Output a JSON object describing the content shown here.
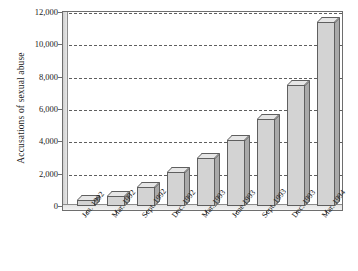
{
  "chart_data": {
    "type": "bar",
    "title": "",
    "xlabel": "",
    "ylabel": "Accusations of sexual abuse",
    "categories": [
      "Jan. 1992",
      "Mar. 1992",
      "Sept. 1992",
      "Dec. 1992",
      "Mar. 1993",
      "June 1993",
      "Sept. 1993",
      "Dec. 1993",
      "Mar. 1994"
    ],
    "values": [
      400,
      600,
      1200,
      2100,
      3000,
      4100,
      5400,
      7500,
      11400
    ],
    "ylim": [
      0,
      12000
    ],
    "ytick_labels": [
      "0",
      "2,000",
      "4,000",
      "6,000",
      "8,000",
      "10,000",
      "12,000"
    ],
    "ytick_values": [
      0,
      2000,
      4000,
      6000,
      8000,
      10000,
      12000
    ],
    "grid": true,
    "grid_style": "dashed-horizontal",
    "legend": null,
    "legend_position": "none",
    "bar_style": "3d",
    "colors": {
      "bar_front": "#d3d3d3",
      "bar_top": "#e6e6e6",
      "bar_side": "#a9a9a9",
      "bar_edge": "#5f5f5f",
      "gridline": "#5e5e5e",
      "frame": "#6e6e6e",
      "text": "#1a1a1a",
      "background": "#ffffff"
    }
  }
}
